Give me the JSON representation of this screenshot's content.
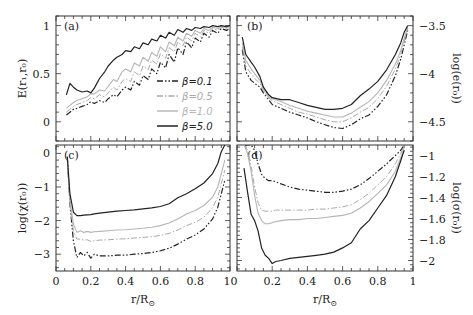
{
  "figure": {
    "x_axis_label": "r/R⊙",
    "x_ticks": [
      "0",
      "0.2",
      "0.4",
      "0.6",
      "0.8",
      "1"
    ],
    "x_ticks_left_panel": [
      "0",
      "0.2",
      "0.4",
      "0.6",
      "0.8",
      "1"
    ]
  },
  "legend": [
    {
      "label": "β=0.1",
      "color": "#222222",
      "dash": "6,2,1.5,2,1.5,2",
      "width": 1.2
    },
    {
      "label": "β=0.5",
      "color": "#aaaaaa",
      "dash": "6,2,1.5,2",
      "width": 1.0
    },
    {
      "label": "β=1.0",
      "color": "#b5b5b5",
      "dash": "",
      "width": 1.1
    },
    {
      "label": "β=5.0",
      "color": "#222222",
      "dash": "",
      "width": 1.2
    }
  ],
  "chart_data": [
    {
      "type": "line",
      "panel": "(a)",
      "title": "",
      "xlabel": "",
      "ylabel": "E(r₁,r₀)",
      "ylabel_side": "left",
      "xlim": [
        0,
        1
      ],
      "ylim": [
        -0.2,
        1.1
      ],
      "yticks": [
        0,
        0.5,
        1
      ],
      "ytick_labels": [
        "0",
        "0.5",
        "1"
      ],
      "legend_position": "lower right",
      "x": [
        0.06,
        0.08,
        0.1,
        0.12,
        0.15,
        0.18,
        0.2,
        0.22,
        0.25,
        0.28,
        0.3,
        0.33,
        0.35,
        0.38,
        0.4,
        0.43,
        0.45,
        0.48,
        0.5,
        0.53,
        0.55,
        0.58,
        0.6,
        0.63,
        0.65,
        0.68,
        0.7,
        0.73,
        0.75,
        0.78,
        0.8,
        0.83,
        0.85,
        0.88,
        0.9,
        0.93,
        0.95,
        0.98,
        1.0
      ],
      "series": [
        {
          "name": "β=0.1",
          "values": [
            0.07,
            0.1,
            0.13,
            0.14,
            0.16,
            0.18,
            0.21,
            0.19,
            0.22,
            0.2,
            0.24,
            0.28,
            0.26,
            0.33,
            0.36,
            0.33,
            0.42,
            0.38,
            0.48,
            0.44,
            0.55,
            0.5,
            0.62,
            0.56,
            0.7,
            0.62,
            0.77,
            0.7,
            0.83,
            0.77,
            0.87,
            0.83,
            0.92,
            0.88,
            0.95,
            0.92,
            0.97,
            0.95,
            0.97
          ]
        },
        {
          "name": "β=0.5",
          "values": [
            0.1,
            0.13,
            0.16,
            0.18,
            0.2,
            0.22,
            0.25,
            0.24,
            0.28,
            0.26,
            0.3,
            0.36,
            0.33,
            0.42,
            0.45,
            0.42,
            0.52,
            0.48,
            0.58,
            0.54,
            0.64,
            0.6,
            0.71,
            0.66,
            0.77,
            0.73,
            0.83,
            0.79,
            0.88,
            0.84,
            0.92,
            0.88,
            0.95,
            0.92,
            0.97,
            0.95,
            0.98,
            0.97,
            0.98
          ]
        },
        {
          "name": "β=1.0",
          "values": [
            0.14,
            0.17,
            0.2,
            0.22,
            0.24,
            0.26,
            0.29,
            0.29,
            0.33,
            0.32,
            0.37,
            0.44,
            0.42,
            0.52,
            0.55,
            0.52,
            0.61,
            0.58,
            0.67,
            0.63,
            0.72,
            0.68,
            0.78,
            0.73,
            0.83,
            0.79,
            0.88,
            0.84,
            0.92,
            0.89,
            0.95,
            0.92,
            0.97,
            0.95,
            0.98,
            0.97,
            0.99,
            0.98,
            0.99
          ]
        },
        {
          "name": "β=5.0",
          "values": [
            0.28,
            0.4,
            0.36,
            0.33,
            0.31,
            0.32,
            0.3,
            0.35,
            0.45,
            0.52,
            0.58,
            0.64,
            0.67,
            0.7,
            0.74,
            0.73,
            0.78,
            0.76,
            0.82,
            0.8,
            0.86,
            0.84,
            0.9,
            0.87,
            0.93,
            0.9,
            0.96,
            0.93,
            0.97,
            0.95,
            0.98,
            0.97,
            0.99,
            0.98,
            1.0,
            0.99,
            1.0,
            0.99,
            1.0
          ]
        }
      ]
    },
    {
      "type": "line",
      "panel": "(b)",
      "title": "",
      "xlabel": "",
      "ylabel": "log(e(r₀))",
      "ylabel_side": "right",
      "xlim": [
        0,
        1
      ],
      "ylim": [
        -4.7,
        -3.4
      ],
      "yticks": [
        -3.5,
        -4,
        -4.5
      ],
      "ytick_labels": [
        "-3.5",
        "-4",
        "-4.5"
      ],
      "x": [
        0.03,
        0.05,
        0.08,
        0.1,
        0.13,
        0.15,
        0.18,
        0.2,
        0.25,
        0.3,
        0.35,
        0.4,
        0.45,
        0.5,
        0.55,
        0.6,
        0.65,
        0.7,
        0.75,
        0.8,
        0.85,
        0.9,
        0.93,
        0.95,
        0.97
      ],
      "series": [
        {
          "name": "β=0.1",
          "values": [
            -3.75,
            -3.98,
            -4.07,
            -4.1,
            -4.14,
            -4.2,
            -4.27,
            -4.32,
            -4.36,
            -4.4,
            -4.43,
            -4.46,
            -4.5,
            -4.53,
            -4.56,
            -4.57,
            -4.53,
            -4.47,
            -4.43,
            -4.34,
            -4.22,
            -4.02,
            -3.85,
            -3.7,
            -3.55
          ]
        },
        {
          "name": "β=0.5",
          "values": [
            -3.72,
            -3.92,
            -4.0,
            -4.05,
            -4.1,
            -4.18,
            -4.25,
            -4.28,
            -4.32,
            -4.36,
            -4.4,
            -4.42,
            -4.45,
            -4.48,
            -4.5,
            -4.5,
            -4.46,
            -4.4,
            -4.35,
            -4.26,
            -4.13,
            -3.95,
            -3.8,
            -3.66,
            -3.53
          ]
        },
        {
          "name": "β=1.0",
          "values": [
            -3.68,
            -3.86,
            -3.95,
            -4.0,
            -4.07,
            -4.16,
            -4.24,
            -4.26,
            -4.29,
            -4.33,
            -4.36,
            -4.39,
            -4.41,
            -4.43,
            -4.45,
            -4.45,
            -4.41,
            -4.35,
            -4.29,
            -4.2,
            -4.07,
            -3.9,
            -3.76,
            -3.63,
            -3.52
          ]
        },
        {
          "name": "β=5.0",
          "values": [
            -3.62,
            -3.8,
            -3.88,
            -3.93,
            -4.03,
            -4.14,
            -4.22,
            -4.25,
            -4.27,
            -4.27,
            -4.3,
            -4.33,
            -4.35,
            -4.37,
            -4.37,
            -4.36,
            -4.32,
            -4.23,
            -4.16,
            -4.08,
            -3.96,
            -3.8,
            -3.68,
            -3.57,
            -3.5
          ]
        }
      ]
    },
    {
      "type": "line",
      "panel": "(c)",
      "title": "",
      "xlabel": "r/R⊙",
      "ylabel": "log(χ(r₀))",
      "ylabel_side": "left",
      "xlim": [
        0,
        1
      ],
      "ylim": [
        -3.5,
        0.25
      ],
      "yticks": [
        0,
        -1,
        -2,
        -3
      ],
      "ytick_labels": [
        "0",
        "-1",
        "-2",
        "-3"
      ],
      "xticks": [
        0,
        0.2,
        0.4,
        0.6,
        0.8,
        1
      ],
      "xtick_labels": [
        "0",
        "0.2",
        "0.4",
        "0.6",
        "0.8",
        "1"
      ],
      "x": [
        0.065,
        0.08,
        0.1,
        0.12,
        0.14,
        0.16,
        0.18,
        0.2,
        0.22,
        0.25,
        0.3,
        0.35,
        0.4,
        0.45,
        0.5,
        0.55,
        0.6,
        0.65,
        0.7,
        0.75,
        0.8,
        0.85,
        0.9,
        0.93,
        0.95,
        0.97
      ],
      "series": [
        {
          "name": "β=0.1",
          "values": [
            -0.1,
            -1.5,
            -2.6,
            -3.1,
            -2.95,
            -3.05,
            -2.95,
            -3.12,
            -3.0,
            -3.05,
            -3.05,
            -3.03,
            -3.03,
            -3.0,
            -2.98,
            -2.95,
            -2.9,
            -2.82,
            -2.7,
            -2.55,
            -2.43,
            -2.25,
            -1.95,
            -1.6,
            -1.2,
            -0.8
          ]
        },
        {
          "name": "β=0.5",
          "values": [
            -0.1,
            -1.5,
            -2.3,
            -2.55,
            -2.55,
            -2.58,
            -2.57,
            -2.62,
            -2.6,
            -2.58,
            -2.57,
            -2.55,
            -2.54,
            -2.52,
            -2.5,
            -2.48,
            -2.44,
            -2.38,
            -2.28,
            -2.15,
            -2.05,
            -1.9,
            -1.62,
            -1.3,
            -0.9,
            -0.5
          ]
        },
        {
          "name": "β=1.0",
          "values": [
            -0.1,
            -1.4,
            -2.1,
            -2.35,
            -2.3,
            -2.35,
            -2.32,
            -2.35,
            -2.33,
            -2.32,
            -2.3,
            -2.28,
            -2.27,
            -2.25,
            -2.23,
            -2.2,
            -2.15,
            -2.07,
            -1.95,
            -1.8,
            -1.7,
            -1.55,
            -1.3,
            -1.0,
            -0.6,
            -0.2
          ]
        },
        {
          "name": "β=5.0",
          "values": [
            -0.1,
            -1.2,
            -1.75,
            -1.85,
            -1.85,
            -1.84,
            -1.83,
            -1.82,
            -1.8,
            -1.78,
            -1.75,
            -1.72,
            -1.7,
            -1.68,
            -1.65,
            -1.62,
            -1.58,
            -1.5,
            -1.32,
            -1.2,
            -1.05,
            -0.88,
            -0.6,
            -0.3,
            0.05,
            0.25
          ]
        }
      ]
    },
    {
      "type": "line",
      "panel": "(d)",
      "title": "",
      "xlabel": "r/R⊙",
      "ylabel": "log(σ(r₀))",
      "ylabel_side": "right",
      "xlim": [
        0,
        1
      ],
      "ylim": [
        -2.1,
        -0.9
      ],
      "yticks": [
        -1,
        -1.2,
        -1.4,
        -1.6,
        -1.8,
        -2
      ],
      "ytick_labels": [
        "-1",
        "-1.2",
        "-1.4",
        "-1.6",
        "-1.8",
        "-2"
      ],
      "xticks": [
        0,
        0.2,
        0.4,
        0.6,
        0.8,
        1
      ],
      "xtick_labels": [
        "0",
        "0.2",
        "0.4",
        "0.6",
        "0.8",
        "1"
      ],
      "x": [
        0.04,
        0.06,
        0.08,
        0.1,
        0.12,
        0.14,
        0.16,
        0.18,
        0.2,
        0.22,
        0.25,
        0.3,
        0.35,
        0.4,
        0.45,
        0.5,
        0.55,
        0.6,
        0.65,
        0.7,
        0.75,
        0.8,
        0.85,
        0.9,
        0.93,
        0.95
      ],
      "series": [
        {
          "name": "β=0.1",
          "values": [
            -0.9,
            -0.9,
            -0.9,
            -0.95,
            -1.08,
            -1.18,
            -1.22,
            -1.24,
            -1.24,
            -1.25,
            -1.27,
            -1.3,
            -1.32,
            -1.33,
            -1.34,
            -1.35,
            -1.35,
            -1.34,
            -1.32,
            -1.28,
            -1.22,
            -1.15,
            -1.08,
            -1.0,
            -0.95,
            -0.9
          ]
        },
        {
          "name": "β=0.5",
          "values": [
            -0.9,
            -0.95,
            -1.1,
            -1.3,
            -1.45,
            -1.52,
            -1.53,
            -1.53,
            -1.53,
            -1.52,
            -1.52,
            -1.52,
            -1.52,
            -1.52,
            -1.51,
            -1.51,
            -1.5,
            -1.49,
            -1.47,
            -1.42,
            -1.36,
            -1.28,
            -1.2,
            -1.08,
            -0.98,
            -0.9
          ]
        },
        {
          "name": "β=1.0",
          "values": [
            -0.9,
            -0.98,
            -1.15,
            -1.38,
            -1.55,
            -1.62,
            -1.65,
            -1.65,
            -1.64,
            -1.63,
            -1.62,
            -1.61,
            -1.61,
            -1.6,
            -1.6,
            -1.59,
            -1.58,
            -1.57,
            -1.55,
            -1.5,
            -1.44,
            -1.36,
            -1.28,
            -1.15,
            -1.02,
            -0.92
          ]
        },
        {
          "name": "β=5.0",
          "values": [
            -1.12,
            -1.35,
            -1.56,
            -1.62,
            -1.72,
            -1.88,
            -1.95,
            -1.98,
            -2.03,
            -2.01,
            -2.0,
            -1.98,
            -1.97,
            -1.96,
            -1.95,
            -1.94,
            -1.92,
            -1.88,
            -1.83,
            -1.7,
            -1.62,
            -1.5,
            -1.38,
            -1.2,
            -1.05,
            -0.95
          ]
        }
      ]
    }
  ]
}
